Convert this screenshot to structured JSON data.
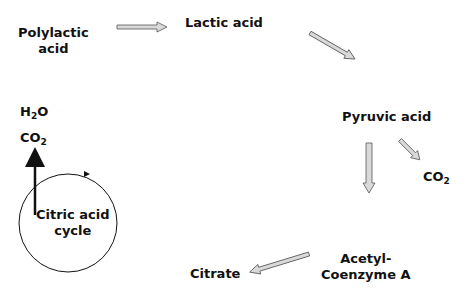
{
  "nodes": {
    "polylactic": {
      "line1": "Polylactic",
      "line2": "acid"
    },
    "lactic": "Lactic acid",
    "pyruvic": "Pyruvic acid",
    "co2_pyruvic": {
      "base": "CO",
      "sub": "2"
    },
    "acetyl": {
      "line1": "Acetyl-",
      "line2": "Coenzyme A"
    },
    "citrate": "Citrate",
    "cycle": {
      "line1": "Citric acid",
      "line2": "cycle"
    },
    "h2o": {
      "a": "H",
      "sub": "2",
      "b": "O"
    },
    "co2_cycle": {
      "base": "CO",
      "sub": "2"
    }
  },
  "colors": {
    "arrow_fill": "#d9d9d9",
    "arrow_stroke": "#555555",
    "text": "#111111"
  }
}
